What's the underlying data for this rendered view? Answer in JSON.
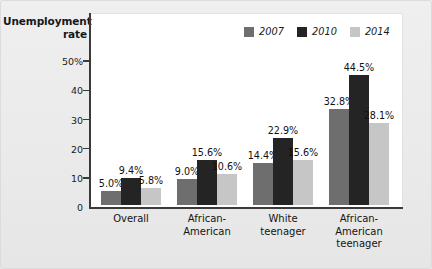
{
  "chart_data": {
    "type": "bar",
    "title": "",
    "ylabel": "Unemployment rate",
    "xlabel": "",
    "ylim": [
      0,
      50
    ],
    "grid": false,
    "legend_position": "top-right",
    "categories": [
      "Overall",
      "African-\nAmerican",
      "White\nteenager",
      "African-\nAmerican\nteenager"
    ],
    "ytick_labels": [
      "50%",
      "40",
      "30",
      "20",
      "10",
      "0"
    ],
    "ytick_values": [
      50,
      40,
      30,
      20,
      10,
      0
    ],
    "series": [
      {
        "name": "2007",
        "color": "#6e6e6e",
        "values": [
          5.0,
          9.0,
          14.4,
          32.8
        ],
        "labels": [
          "5.0%",
          "9.0%",
          "14.4%",
          "32.8%"
        ]
      },
      {
        "name": "2010",
        "color": "#242424",
        "values": [
          9.4,
          15.6,
          22.9,
          44.5
        ],
        "labels": [
          "9.4%",
          "15.6%",
          "22.9%",
          "44.5%"
        ]
      },
      {
        "name": "2014",
        "color": "#c6c6c6",
        "values": [
          5.8,
          10.6,
          15.6,
          28.1
        ],
        "labels": [
          "5.8%",
          "10.6%",
          "15.6%",
          "28.1%"
        ]
      }
    ]
  },
  "axis_title_line1": "Unemployment",
  "axis_title_line2": "rate"
}
